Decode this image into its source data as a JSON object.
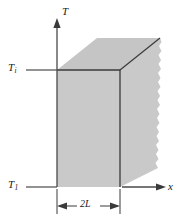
{
  "figure": {
    "type": "engineering-diagram",
    "axes": {
      "vertical": {
        "label": "T",
        "direction": "up"
      },
      "horizontal": {
        "label": "x",
        "direction": "right"
      }
    },
    "labels": {
      "initial_temperature": {
        "symbol": "T",
        "subscript": "i"
      },
      "surface_temperature": {
        "symbol": "T",
        "subscript": "1"
      },
      "thickness": {
        "text": "2L"
      }
    },
    "colors": {
      "solid_fill": "#c9c9c9",
      "top_face_fill": "#c4c4c4",
      "outline": "#3a3a3a",
      "axis": "#4a4a4a",
      "background": "#ffffff",
      "text": "#1a1a1a"
    },
    "geometry": {
      "front_face": {
        "left": 57,
        "right": 120,
        "top": 70,
        "bottom": 187
      },
      "depth_offset": {
        "dx": 40,
        "dy": -32
      },
      "torn_right_edge": true
    }
  }
}
